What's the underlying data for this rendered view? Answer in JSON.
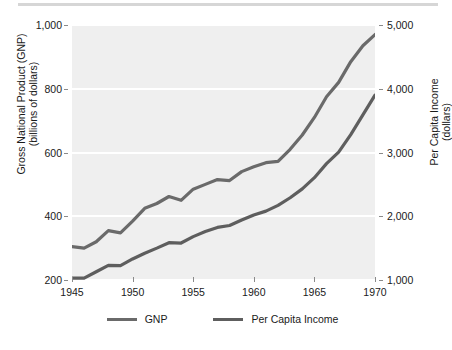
{
  "chart_data": {
    "type": "line",
    "title": "",
    "xlabel": "",
    "ylabel": "Gross National Product (GNP) (billions of dollars)",
    "y2label": "Per Capita Income (dollars)",
    "grid": true,
    "legend_position": "bottom",
    "xlim": [
      1945,
      1970
    ],
    "ylim": [
      200,
      1000
    ],
    "y2lim": [
      1000,
      5000
    ],
    "xticks": [
      "1945",
      "1950",
      "1955",
      "1960",
      "1965",
      "1970"
    ],
    "xtick_values": [
      1945,
      1950,
      1955,
      1960,
      1965,
      1970
    ],
    "yticks": [
      "200",
      "400",
      "600",
      "800",
      "1,000"
    ],
    "ytick_values": [
      200,
      400,
      600,
      800,
      1000
    ],
    "y2ticks": [
      "1,000",
      "2,000",
      "3,000",
      "4,000",
      "5,000"
    ],
    "y2tick_values": [
      1000,
      2000,
      3000,
      4000,
      5000
    ],
    "x": [
      1945,
      1946,
      1947,
      1948,
      1949,
      1950,
      1951,
      1952,
      1953,
      1954,
      1955,
      1956,
      1957,
      1958,
      1959,
      1960,
      1961,
      1962,
      1963,
      1964,
      1965,
      1966,
      1967,
      1968,
      1969,
      1970
    ],
    "series": [
      {
        "name": "GNP",
        "color": "#6a6a6a",
        "axis": "left",
        "units": "billions of dollars",
        "values": [
          305,
          300,
          320,
          355,
          348,
          385,
          425,
          440,
          462,
          450,
          485,
          500,
          515,
          512,
          540,
          555,
          568,
          572,
          610,
          655,
          710,
          775,
          820,
          885,
          935,
          970
        ]
      },
      {
        "name": "Per Capita Income",
        "color": "#5e5e5e",
        "axis": "right",
        "units": "dollars",
        "values": [
          1030,
          1030,
          1130,
          1230,
          1225,
          1330,
          1420,
          1500,
          1585,
          1580,
          1680,
          1760,
          1825,
          1855,
          1940,
          2020,
          2080,
          2170,
          2290,
          2430,
          2605,
          2825,
          3005,
          3280,
          3590,
          3900
        ]
      }
    ],
    "legend": [
      {
        "label": "GNP",
        "color": "#6a6a6a"
      },
      {
        "label": "Per Capita Income",
        "color": "#5e5e5e"
      }
    ]
  }
}
